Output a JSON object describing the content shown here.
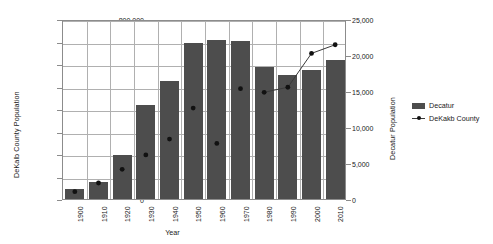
{
  "chart_data": {
    "type": "bar",
    "title": "",
    "xlabel": "Year",
    "ylabel": "DeKalb County Population",
    "y2label": "Decatur Population",
    "categories": [
      "1900",
      "1910",
      "1920",
      "1930",
      "1940",
      "1950",
      "1960",
      "1970",
      "1980",
      "1990",
      "2000",
      "2010"
    ],
    "ylim": [
      0,
      800000
    ],
    "yticks": [
      "0",
      "100,000",
      "200,000",
      "300,000",
      "400,000",
      "500,000",
      "600,000",
      "700,000",
      "800,000"
    ],
    "ytick_values": [
      0,
      100000,
      200000,
      300000,
      400000,
      500000,
      600000,
      700000,
      800000
    ],
    "y2lim": [
      0,
      25000
    ],
    "y2ticks": [
      "0",
      "5,000",
      "10,000",
      "15,000",
      "20,000",
      "25,000"
    ],
    "y2tick_values": [
      0,
      5000,
      10000,
      15000,
      20000,
      25000
    ],
    "grid": true,
    "legend_position": "right",
    "series": [
      {
        "name": "Decatur",
        "type": "bar",
        "axis": "left",
        "color": "#4d4d4d",
        "values": [
          45000,
          75000,
          195000,
          420000,
          525000,
          694000,
          705000,
          702000,
          585000,
          550000,
          575000,
          617000
        ]
      },
      {
        "name": "DeKakb County",
        "type": "line",
        "axis": "right",
        "color": "#3a3a3a",
        "values": [
          1300,
          2500,
          4400,
          6400,
          8600,
          12900,
          8000,
          15600,
          15100,
          15800,
          20500,
          21700
        ]
      }
    ]
  },
  "legend": {
    "items": [
      {
        "label": "Decatur",
        "marker": "bar-swatch"
      },
      {
        "label": "DeKakb County",
        "marker": "line-marker-swatch"
      }
    ]
  }
}
